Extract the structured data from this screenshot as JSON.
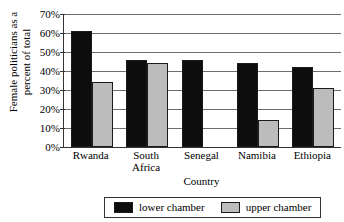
{
  "chart_data": {
    "type": "bar",
    "title": "",
    "xlabel": "Country",
    "ylabel": "Female politicians as a percent of total",
    "ylabel_lines": [
      "Female politicians as a",
      "percent of total"
    ],
    "categories": [
      "Rwanda",
      "South Africa",
      "Senegal",
      "Namibia",
      "Ethiopia"
    ],
    "category_labels": [
      "Rwanda",
      "South\nAfrica",
      "Senegal",
      "Namibia",
      "Ethiopia"
    ],
    "series": [
      {
        "name": "lower chamber",
        "color": "#0d0d0d",
        "values": [
          61,
          46,
          46,
          44,
          42
        ]
      },
      {
        "name": "upper chamber",
        "color": "#bcbcbc",
        "values": [
          34,
          44,
          null,
          14,
          31
        ]
      }
    ],
    "ylim": [
      0,
      70
    ],
    "ytick_values": [
      0,
      10,
      20,
      30,
      40,
      50,
      60,
      70
    ],
    "ytick_labels": [
      "0%",
      "10%",
      "20%",
      "30%",
      "40%",
      "50%",
      "60%",
      "70%"
    ],
    "grid": true,
    "legend_position": "bottom"
  },
  "legend": {
    "items": [
      {
        "label": "lower chamber",
        "color": "#0d0d0d"
      },
      {
        "label": "upper chamber",
        "color": "#bcbcbc"
      }
    ]
  }
}
